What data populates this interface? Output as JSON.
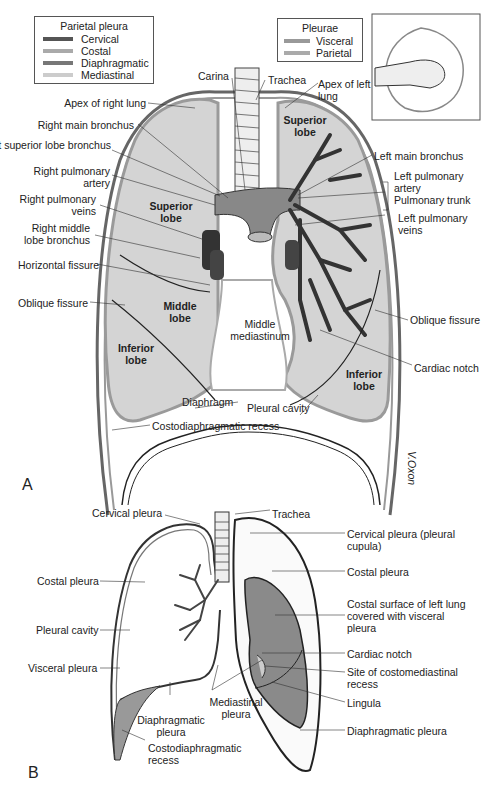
{
  "figure_a": {
    "panel_label": "A",
    "legend_parietal": {
      "title": "Parietal pleura",
      "items": [
        {
          "label": "Cervical",
          "color": "#555555"
        },
        {
          "label": "Costal",
          "color": "#aaaaaa"
        },
        {
          "label": "Diaphragmatic",
          "color": "#777777"
        },
        {
          "label": "Mediastinal",
          "color": "#cccccc"
        }
      ]
    },
    "legend_pleurae": {
      "title": "Pleurae",
      "items": [
        {
          "label": "Visceral",
          "color": "#999999"
        },
        {
          "label": "Parietal",
          "color": "#aaaaaa"
        }
      ]
    },
    "inset": {
      "description": "fist-in-balloon analogy"
    },
    "labels_left": [
      "Apex of right lung",
      "Right main bronchus",
      "Right superior lobe bronchus",
      "Right pulmonary artery",
      "Right pulmonary veins",
      "Right middle lobe bronchus",
      "Horizontal fissure",
      "Oblique fissure"
    ],
    "labels_top": [
      "Carina",
      "Trachea",
      "Apex of left lung"
    ],
    "labels_right": [
      "Left main bronchus",
      "Left pulmonary artery",
      "Pulmonary trunk",
      "Left pulmonary veins",
      "Oblique fissure",
      "Cardiac notch"
    ],
    "lobes": {
      "right_superior": "Superior lobe",
      "right_middle": "Middle lobe",
      "right_inferior": "Inferior lobe",
      "left_superior": "Superior lobe",
      "left_inferior": "Inferior lobe"
    },
    "center": "Middle mediastinum",
    "bottom_labels": [
      "Diaphragm",
      "Pleural cavity",
      "Costodiaphragmatic recess"
    ],
    "signature": "V.Oxon"
  },
  "figure_b": {
    "panel_label": "B",
    "labels_left": [
      "Cervical pleura",
      "Costal pleura",
      "Pleural cavity",
      "Visceral pleura",
      "Diaphragmatic pleura",
      "Costodiaphragmatic recess",
      "Mediastinal pleura"
    ],
    "labels_right": [
      "Trachea",
      "Cervical pleura (pleural cupula)",
      "Costal pleura",
      "Costal surface of left lung covered with visceral pleura",
      "Cardiac notch",
      "Site of costomediastinal recess",
      "Lingula",
      "Diaphragmatic pleura"
    ]
  }
}
